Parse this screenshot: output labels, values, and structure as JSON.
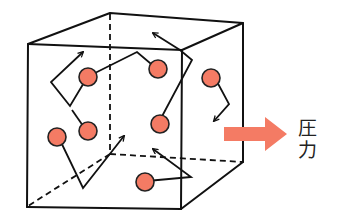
{
  "diagram": {
    "pressure_label_chars": [
      "圧",
      "力"
    ],
    "pressure_label": "圧力",
    "colors": {
      "molecule_fill": "#f47b64",
      "pressure_arrow": "#f47b64",
      "line": "#111111"
    },
    "molecule_count": 8,
    "elements": {
      "container": "cube",
      "molecules": "red circles with zigzag motion paths and arrowheads",
      "pressure_arrow": "right-pointing arrow from right face"
    }
  }
}
